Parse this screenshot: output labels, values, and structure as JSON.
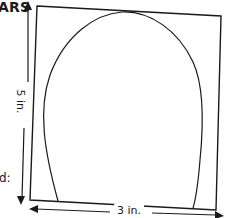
{
  "header": {
    "title_fragment": "ARS"
  },
  "side_text": {
    "fragment": "d:"
  },
  "diagram": {
    "height_label": "5 in.",
    "width_label": "3 in.",
    "stroke_color": "#1a1a1a",
    "background_color": "#ffffff"
  }
}
